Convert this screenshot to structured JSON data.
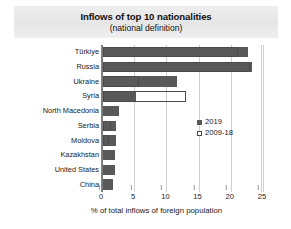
{
  "chart_data": {
    "type": "bar",
    "orientation": "horizontal",
    "title": "Inflows of top 10 nationalities",
    "subtitle": "(national definition)",
    "xlabel": "% of total inflows of foreign population",
    "ylabel": "",
    "xlim": [
      0,
      25
    ],
    "xticks": [
      0,
      5,
      10,
      15,
      20,
      25
    ],
    "grid": true,
    "legend_position": "inside-right",
    "categories": [
      "Türkiye",
      "Russia",
      "Ukraine",
      "Syria",
      "North Macedonia",
      "Serbia",
      "Moldova",
      "Kazakhstan",
      "United States",
      "China"
    ],
    "series": [
      {
        "name": "2019",
        "style": "filled",
        "color": "#595959",
        "values": [
          22.5,
          23.1,
          11.5,
          5.1,
          2.5,
          2.0,
          2.0,
          1.9,
          1.8,
          1.6
        ]
      },
      {
        "name": "2009-18",
        "style": "open",
        "color": "#ffffff",
        "values": [
          21.0,
          22.8,
          5.6,
          12.9,
          0,
          1.2,
          0.9,
          0,
          0,
          0
        ]
      }
    ]
  },
  "header": {
    "title": "Inflows of top 10 nationalities",
    "subtitle": "(national definition)"
  },
  "legend": {
    "items": [
      {
        "label": "2019"
      },
      {
        "label": "2009-18"
      }
    ]
  },
  "axis": {
    "x_label": "% of total inflows of foreign population",
    "x_ticks": [
      "0",
      "5",
      "10",
      "15",
      "20",
      "25"
    ]
  }
}
